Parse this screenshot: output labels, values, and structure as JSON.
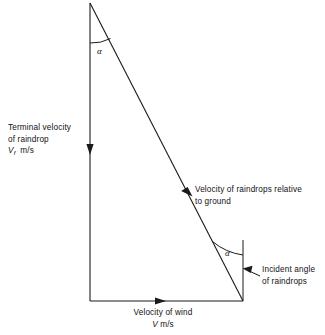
{
  "figure": {
    "line_color": "#1a1a1a",
    "background": "#ffffff"
  },
  "geometry": {
    "apex": {
      "x": 90,
      "y": 3
    },
    "bottom_left": {
      "x": 90,
      "y": 301
    },
    "bottom_right": {
      "x": 243,
      "y": 301
    },
    "reference_vertical_top": {
      "x": 243,
      "y": 240
    }
  },
  "labels": {
    "terminal_velocity": {
      "line1": "Terminal velocity",
      "line2": "of raindrop",
      "symbol": "V",
      "subscript": "f",
      "units": "m/s"
    },
    "relative_velocity": {
      "line1": "Velocity of raindrops relative",
      "line2": "to ground"
    },
    "incident_angle": {
      "line1": "Incident angle",
      "line2": "of raindrops"
    },
    "wind_velocity": {
      "line1": "Velocity of wind",
      "symbol": "V",
      "units": "m/s"
    },
    "angle_top": "α",
    "angle_bottom": "α"
  },
  "annotations": {
    "arrow_terminal_velocity": "downward-arrow",
    "arrow_relative_velocity": "down-right-arrow",
    "arrow_wind_velocity": "rightward-arrow",
    "arrow_incident_angle_leader": "left-pointing-leader-arrow"
  }
}
